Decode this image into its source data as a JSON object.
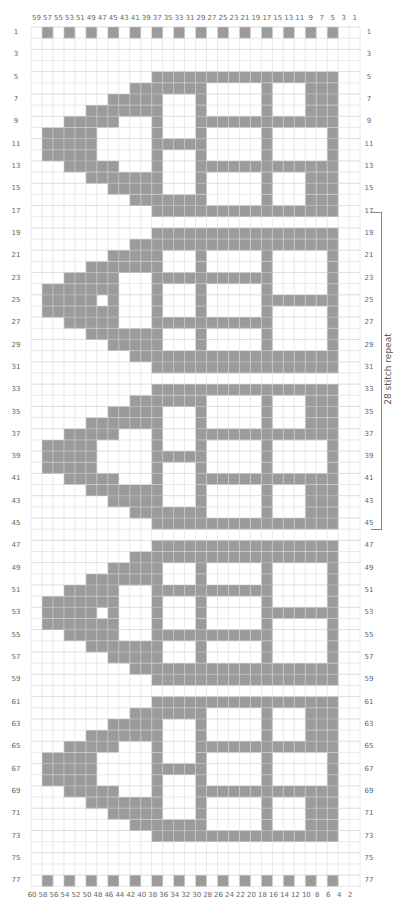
{
  "chart_data": {
    "type": "heatmap",
    "title": "",
    "columns": 30,
    "rows": 77,
    "colors": {
      "shaded": "#9b9b9b",
      "background": "#ffffff",
      "grid": "#dcdcdc",
      "grid_major": "#c8c8c8",
      "label": "#666666"
    },
    "top_labels": [
      "59",
      "57",
      "55",
      "53",
      "51",
      "49",
      "47",
      "45",
      "43",
      "41",
      "39",
      "37",
      "35",
      "33",
      "31",
      "29",
      "27",
      "25",
      "23",
      "21",
      "19",
      "17",
      "15",
      "13",
      "11",
      "9",
      "7",
      "5",
      "3",
      "1"
    ],
    "bottom_labels": [
      "60",
      "58",
      "56",
      "54",
      "52",
      "50",
      "48",
      "46",
      "44",
      "42",
      "40",
      "38",
      "36",
      "34",
      "32",
      "30",
      "28",
      "26",
      "24",
      "22",
      "20",
      "18",
      "16",
      "14",
      "12",
      "10",
      "8",
      "6",
      "4",
      "2"
    ],
    "row_labels": [
      "1",
      "3",
      "5",
      "7",
      "9",
      "11",
      "13",
      "15",
      "17",
      "19",
      "21",
      "23",
      "25",
      "27",
      "29",
      "31",
      "33",
      "35",
      "37",
      "39",
      "41",
      "43",
      "45",
      "47",
      "49",
      "51",
      "53",
      "55",
      "57",
      "59",
      "61",
      "63",
      "65",
      "67",
      "69",
      "71",
      "73",
      "75",
      "77"
    ],
    "repeat_bracket": {
      "label": "28 stitch repeat",
      "from_row": 17,
      "to_row": 45
    },
    "border_row": ".#.#.#.#.#.#.#.#.#.#.#.#.#.#..",
    "border_rows": [
      1,
      77
    ],
    "motifs": {
      "A": [
        "...........#################..",
        ".........#######.....#...###..",
        ".......#####...#.....#...###..",
        ".....#######...#.....#...###..",
        "...#####...#...#############..",
        ".#####.....#...#.....#.....#..",
        ".#####.....#####.....#.....#..",
        ".#####.....#...#.....#.....#..",
        "...#####...#...#############..",
        ".....#######...#.....#...###..",
        ".......#####...#.....#...###..",
        ".........#######.....#...###..",
        "...........#################.."
      ],
      "B": [
        "...........#################..",
        ".........###################..",
        ".......#####...#.....#.....#..",
        ".....#######...#.....#.....#..",
        "...#####...###########.....#..",
        ".#######...#...#.....#.....#..",
        ".#####.#...#...#.....#######..",
        ".#######...#...#.....#.....#..",
        "...#####...###########.....#..",
        ".....#######...#.....#.....#..",
        ".......#####...#.....#.....#..",
        ".........###################..",
        "...........#################.."
      ]
    },
    "motif_placements": [
      {
        "motif": "A",
        "start_row": 5
      },
      {
        "motif": "B",
        "start_row": 19
      },
      {
        "motif": "A",
        "start_row": 33
      },
      {
        "motif": "B",
        "start_row": 47
      },
      {
        "motif": "A",
        "start_row": 61
      }
    ]
  }
}
